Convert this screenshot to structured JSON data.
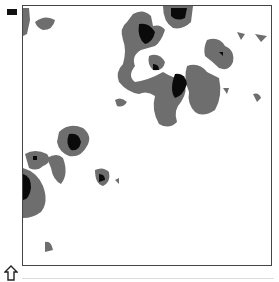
{
  "view": {
    "type": "contour-map",
    "levels": [
      "low",
      "high"
    ],
    "colors": {
      "background": "#ffffff",
      "level1": "#6e6e6e",
      "level2": "#0a0a0a",
      "border": "#444444"
    }
  },
  "icons": {
    "menu": "menu-bar-icon",
    "home": "up-arrow-home-icon"
  }
}
